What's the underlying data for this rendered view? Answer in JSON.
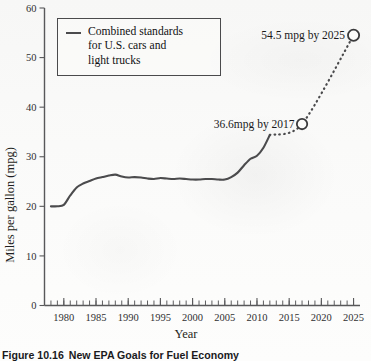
{
  "figure": {
    "caption_number": "Figure 10.16",
    "caption_title": "New EPA Goals for Fuel Economy"
  },
  "legend": {
    "label": "Combined standards\nfor U.S. cars and\nlight trucks",
    "swatch_color": "#4b4b4d"
  },
  "annotations": {
    "near_term": "36.6mpg by 2017",
    "long_term": "54.5 mpg by 2025"
  },
  "axes": {
    "y_title": "Miles per gallon (mpg)",
    "x_title": "Year",
    "y_ticks": [
      "0",
      "10",
      "20",
      "30",
      "40",
      "50",
      "60"
    ],
    "x_ticks": [
      "1980",
      "1985",
      "1990",
      "1995",
      "2000",
      "2005",
      "2010",
      "2015",
      "2020",
      "2025"
    ]
  },
  "chart_data": {
    "type": "line",
    "title": "New EPA Goals for Fuel Economy",
    "xlabel": "Year",
    "ylabel": "Miles per gallon (mpg)",
    "xlim": [
      1977,
      2026
    ],
    "ylim": [
      0,
      60
    ],
    "grid": false,
    "legend_position": "upper-left",
    "series": [
      {
        "name": "Combined standards for U.S. cars and light trucks",
        "style": "solid",
        "x": [
          1978,
          1979,
          1980,
          1981,
          1982,
          1983,
          1984,
          1985,
          1986,
          1987,
          1988,
          1989,
          1990,
          1991,
          1992,
          1993,
          1994,
          1995,
          1996,
          1997,
          1998,
          1999,
          2000,
          2001,
          2002,
          2003,
          2004,
          2005,
          2006,
          2007,
          2008,
          2009,
          2010,
          2011,
          2012
        ],
        "y": [
          20.0,
          20.0,
          20.3,
          22.2,
          23.8,
          24.6,
          25.1,
          25.6,
          25.9,
          26.2,
          26.4,
          26.0,
          25.8,
          25.9,
          25.8,
          25.6,
          25.5,
          25.7,
          25.6,
          25.5,
          25.6,
          25.5,
          25.4,
          25.4,
          25.5,
          25.5,
          25.4,
          25.4,
          25.9,
          26.8,
          28.3,
          29.6,
          30.2,
          31.8,
          34.4
        ]
      },
      {
        "name": "Projected standards",
        "style": "dotted",
        "x": [
          2012,
          2017,
          2025
        ],
        "y": [
          34.4,
          36.6,
          54.5
        ]
      }
    ],
    "markers": [
      {
        "x": 2017,
        "y": 36.6,
        "label": "36.6mpg by 2017",
        "shape": "open-circle"
      },
      {
        "x": 2025,
        "y": 54.5,
        "label": "54.5 mpg by 2025",
        "shape": "open-circle"
      }
    ]
  }
}
